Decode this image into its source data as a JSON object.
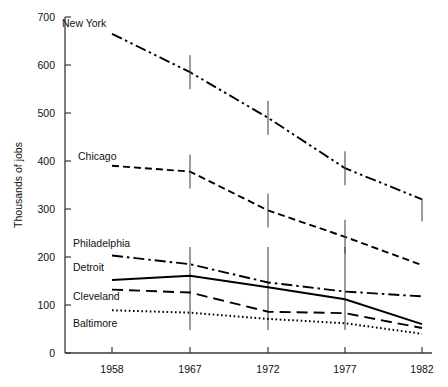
{
  "chart_data": {
    "type": "line",
    "title": "",
    "xlabel": "",
    "ylabel": "Thousands of jobs",
    "x": [
      1958,
      1967,
      1972,
      1977,
      1982
    ],
    "xticklabels": [
      "1958",
      "1967",
      "1972",
      "1977",
      "1982"
    ],
    "yticks": [
      0,
      100,
      200,
      300,
      400,
      500,
      600,
      700
    ],
    "yticklabels": [
      "0",
      "100",
      "200",
      "300",
      "400",
      "500",
      "600",
      "700"
    ],
    "ylim": [
      0,
      700
    ],
    "grid": false,
    "legend_position": "inline-labels",
    "series": [
      {
        "name": "New York",
        "values": [
          665,
          585,
          490,
          385,
          320
        ],
        "style": "dash-dot-dot"
      },
      {
        "name": "Chicago",
        "values": [
          390,
          378,
          297,
          242,
          183
        ],
        "style": "dashed"
      },
      {
        "name": "Philadelphia",
        "values": [
          203,
          185,
          147,
          128,
          118
        ],
        "style": "dash-dot"
      },
      {
        "name": "Detroit",
        "values": [
          152,
          161,
          137,
          112,
          60
        ],
        "style": "solid"
      },
      {
        "name": "Cleveland",
        "values": [
          132,
          126,
          86,
          83,
          52
        ],
        "style": "long-dash"
      },
      {
        "name": "Baltimore",
        "values": [
          89,
          84,
          71,
          62,
          40
        ],
        "style": "dotted"
      }
    ],
    "series_labels": [
      {
        "name": "New York",
        "x": 62,
        "y": 27
      },
      {
        "name": "Chicago",
        "x": 78,
        "y": 160
      },
      {
        "name": "Philadelphia",
        "x": 73,
        "y": 247
      },
      {
        "name": "Detroit",
        "x": 73,
        "y": 271
      },
      {
        "name": "Cleveland",
        "x": 73,
        "y": 300
      },
      {
        "name": "Baltimore",
        "x": 73,
        "y": 327
      }
    ],
    "colors": {
      "ink": "#000000",
      "axis": "#3a3a3a",
      "background": "#ffffff"
    }
  }
}
